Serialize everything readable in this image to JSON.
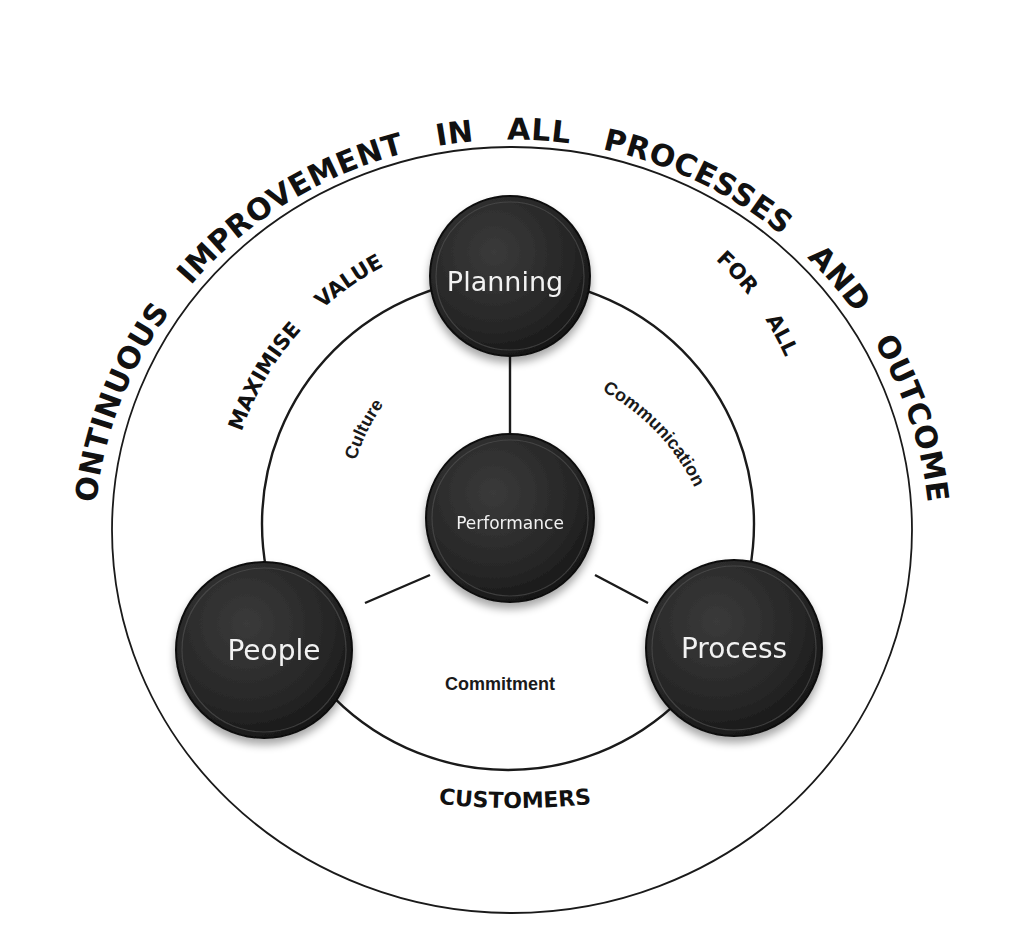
{
  "diagram": {
    "outer_ring": {
      "label_words": [
        "CONTINUOUS",
        "IMPROVEMENT",
        "IN",
        "ALL",
        "PROCESSES",
        "AND",
        "OUTCOMES"
      ],
      "label": "CONTINUOUS   IMPROVEMENT   IN   ALL   PROCESSES   AND   OUTCOMES",
      "bottom_label": "CUSTOMERS"
    },
    "middle_ring": {
      "left_label": "MAXIMISE    VALUE",
      "right_label": "FOR    ALL"
    },
    "inner_ring": {
      "left_label": "Culture",
      "right_label": "Communication",
      "bottom_label": "Commitment"
    },
    "nodes": {
      "top": {
        "label": "Planning"
      },
      "center": {
        "label": "Performance"
      },
      "left": {
        "label": "People"
      },
      "right": {
        "label": "Process"
      }
    },
    "colors": {
      "node_fill": "#262626",
      "node_highlight": "#555555",
      "line": "#1a1a1a",
      "node_text": "#f2f2f2",
      "background": "#ffffff"
    }
  }
}
